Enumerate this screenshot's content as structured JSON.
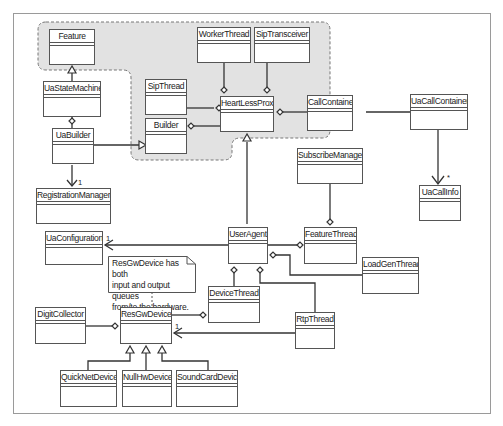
{
  "diagram": {
    "type": "UML class diagram",
    "package_region": "shaded dashed package containing Feature, WorkerThread, SipTransceiver, SipThread, HeartLessProxy, Builder, CallContainer",
    "classes": {
      "feature": "Feature",
      "ua_state_machine": "UaStateMachine",
      "ua_builder": "UaBuilder",
      "registration_manager": "RegistrationManager",
      "worker_thread": "WorkerThread",
      "sip_transceiver": "SipTransceiver",
      "sip_thread": "SipThread",
      "heartless_proxy": "HeartLessProxy",
      "builder": "Builder",
      "call_container": "CallContainer",
      "ua_call_container": "UaCallContainer",
      "ua_call_info": "UaCallInfo",
      "subscribe_manager": "SubscribeManager",
      "ua_configuration": "UaConfiguration",
      "user_agent": "UserAgent",
      "feature_thread": "FeatureThread",
      "load_gen_thread": "LoadGenThread",
      "device_thread": "DeviceThread",
      "rtp_thread": "RtpThread",
      "digit_collector": "DigitCollector",
      "res_gw_device": "ResGwDevice",
      "quick_net_device": "QuickNetDevice",
      "null_hw_device": "NullHwDevice",
      "sound_card_device": "SoundCardDevice"
    },
    "note": {
      "line1": "ResGwDevice has both",
      "line2": "input and output queues",
      "line3": "from/to the hardware."
    },
    "multiplicities": {
      "registration_manager": "1",
      "ua_configuration": "1",
      "ua_call_info": "*",
      "res_gw_device": "1"
    },
    "colors": {
      "package_fill": "#e2e2e2",
      "line": "#333333",
      "frame": "#9a9a9a"
    }
  }
}
